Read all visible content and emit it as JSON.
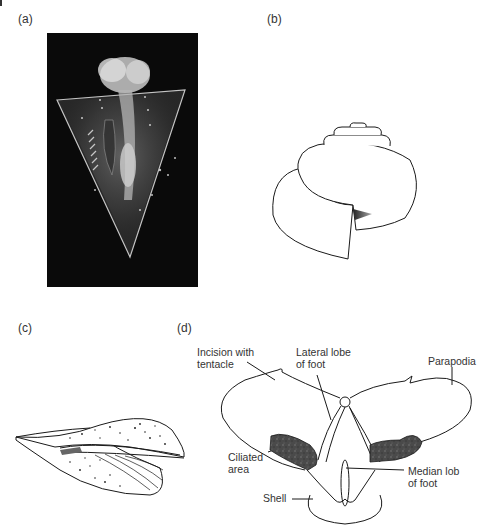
{
  "figure": {
    "panels": [
      {
        "id": "a",
        "label": "(a)",
        "content": "photograph of transparent pteropod on black background"
      },
      {
        "id": "b",
        "label": "(b)",
        "content": "line drawing of coiled snail shell"
      },
      {
        "id": "c",
        "label": "(c)",
        "content": "stippled line drawing of elongated conical shell with wings"
      },
      {
        "id": "d",
        "label": "(d)",
        "content": "labelled line drawing of pteropod with parapodia"
      }
    ],
    "annotations_d": {
      "incision": "Incision with\ntentacle",
      "lateral_lobe": "Lateral lobe\nof foot",
      "parapodia": "Parapodia",
      "ciliated": "Ciliated\narea",
      "median_lobe": "Median lob\nof foot",
      "shell": "Shell"
    },
    "colors": {
      "line": "#1a1a1a",
      "photo_bg": "#0a0a0a",
      "ciliated_fill": "#4a4a4a"
    }
  }
}
